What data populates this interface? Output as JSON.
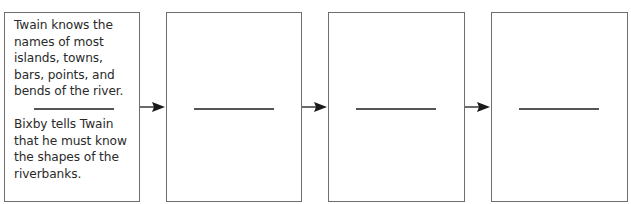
{
  "diagram": {
    "type": "sequence-chain",
    "boxes": [
      {
        "top_text": "Twain knows the names of most islands, towns, bars, points, and bends of the river.",
        "top_lines": [
          "Twain knows the",
          "names of most",
          "islands, towns,",
          "bars, points, and",
          "bends of the river."
        ],
        "bottom_text": "Bixby tells Twain that he must know the shapes of the riverbanks.",
        "bottom_lines": [
          "Bixby tells Twain",
          "that he must know",
          "the shapes of the",
          "riverbanks."
        ]
      },
      {
        "top_text": "",
        "bottom_text": ""
      },
      {
        "top_text": "",
        "bottom_text": ""
      },
      {
        "top_text": "",
        "bottom_text": ""
      }
    ],
    "arrows": [
      {
        "from": 1,
        "to": 2
      },
      {
        "from": 2,
        "to": 3
      },
      {
        "from": 3,
        "to": 4
      }
    ],
    "colors": {
      "border": "#6e6e6e",
      "text": "#2a2a2a",
      "arrow": "#1a1a1a"
    }
  }
}
